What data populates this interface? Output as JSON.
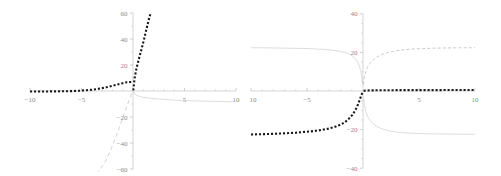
{
  "figure": {
    "title": "",
    "plot_count": 2,
    "background_color": "#ffffff"
  },
  "chart_data": [
    {
      "id": "left-plot",
      "type": "line",
      "title": "",
      "xlabel": "",
      "ylabel": "",
      "xlim": [
        -10,
        10
      ],
      "ylim": [
        -60,
        60
      ],
      "grid": false,
      "legend": null,
      "axis_style": "crossed-at-origin",
      "xticks": [
        -10,
        -5,
        5,
        10
      ],
      "xtick_labels": [
        "-10",
        "-5",
        "5",
        "10"
      ],
      "yticks": [
        -60,
        -40,
        -20,
        20,
        40,
        60
      ],
      "ytick_labels": [
        "-60",
        "-40",
        "-20",
        "20",
        "40",
        "60"
      ],
      "minor_tick_spacing_x": 1,
      "minor_tick_spacing_y": 10,
      "series": [
        {
          "name": "black-dotted-branch",
          "style": "dotted",
          "color": "#1a1a1a",
          "width": 2.1,
          "x": [
            -10,
            -9.5,
            -9,
            -8.5,
            -8,
            -7.5,
            -7,
            -6.5,
            -6,
            -5.5,
            -5,
            -4.5,
            -4,
            -3.5,
            -3,
            -2.5,
            -2,
            -1.5,
            -1,
            -0.75,
            -0.5,
            -0.25,
            -0.12,
            -0.05
          ],
          "y": [
            -0.4,
            -0.4,
            -0.4,
            -0.4,
            -0.3,
            -0.3,
            -0.2,
            -0.2,
            -0.1,
            0.1,
            0.3,
            0.6,
            1.0,
            1.5,
            2.2,
            3.0,
            4.0,
            5.0,
            6.0,
            6.5,
            6.8,
            6.9,
            6.9,
            6.8
          ]
        },
        {
          "name": "black-dotted-steep-branch",
          "style": "dotted",
          "color": "#1a1a1a",
          "width": 2.1,
          "x": [
            0.02,
            0.08,
            0.16,
            0.3,
            0.45,
            0.6,
            0.75,
            0.9,
            1.05,
            1.2,
            1.35,
            1.5,
            1.62,
            1.72
          ],
          "y": [
            0.5,
            4.0,
            10.0,
            16.0,
            21.0,
            25.5,
            30.0,
            34.5,
            39.0,
            44.0,
            49.0,
            54.0,
            57.5,
            59.8
          ]
        },
        {
          "name": "gray-solid-lower-branch",
          "style": "solid",
          "color": "#cfcfcf",
          "width": 0.7,
          "x": [
            0.05,
            0.3,
            0.8,
            1.5,
            2.5,
            4,
            6,
            8,
            10
          ],
          "y": [
            -1.0,
            -3.2,
            -4.6,
            -5.4,
            -6.2,
            -7.0,
            -7.6,
            -8.0,
            -8.3
          ]
        },
        {
          "name": "gray-dashed-steep-descending",
          "style": "dashed",
          "color": "#cccccc",
          "width": 0.9,
          "x": [
            -0.15,
            -0.6,
            -1.1,
            -1.6,
            -2.1,
            -2.6,
            -3.0,
            -3.4
          ],
          "y": [
            -2.0,
            -12.0,
            -23.0,
            -34.0,
            -44.0,
            -53.0,
            -58.0,
            -62.0
          ]
        }
      ]
    },
    {
      "id": "right-plot",
      "type": "line",
      "title": "",
      "xlabel": "",
      "ylabel": "",
      "xlim": [
        -10,
        10
      ],
      "ylim": [
        -40,
        40
      ],
      "grid": false,
      "legend": null,
      "axis_style": "crossed-at-origin",
      "xticks": [
        -10,
        -5,
        5,
        10
      ],
      "xtick_labels": [
        "-10",
        "-5",
        "5",
        "10"
      ],
      "yticks": [
        -40,
        -20,
        20,
        40
      ],
      "ytick_labels": [
        "-40",
        "-20",
        "20",
        "40"
      ],
      "minor_tick_spacing_x": 1,
      "minor_tick_spacing_y": 5,
      "series": [
        {
          "name": "black-dotted-sigmoid-left",
          "style": "dotted",
          "color": "#1a1a1a",
          "width": 2.1,
          "x": [
            -10,
            -9.3,
            -8.6,
            -8,
            -7.3,
            -6.6,
            -6,
            -5.4,
            -4.8,
            -4.2,
            -3.6,
            -3.1,
            -2.6,
            -2.2,
            -1.8,
            -1.5,
            -1.2,
            -0.95,
            -0.75,
            -0.55,
            -0.4,
            -0.28,
            -0.18,
            -0.1,
            -0.05
          ],
          "y": [
            -22.5,
            -22.4,
            -22.3,
            -22.2,
            -22.0,
            -21.8,
            -21.6,
            -21.3,
            -21.0,
            -20.6,
            -20.1,
            -19.5,
            -18.7,
            -17.9,
            -16.8,
            -15.6,
            -14.0,
            -12.4,
            -10.6,
            -8.4,
            -6.3,
            -4.4,
            -2.8,
            -1.5,
            -0.6
          ]
        },
        {
          "name": "black-dotted-flat-right",
          "style": "dotted",
          "color": "#1a1a1a",
          "width": 2.1,
          "x": [
            0.05,
            0.6,
            1.2,
            1.9,
            2.6,
            3.3,
            4.1,
            4.9,
            5.7,
            6.5,
            7.3,
            8.1,
            8.9,
            9.6,
            10
          ],
          "y": [
            0.15,
            0.3,
            0.35,
            0.4,
            0.42,
            0.44,
            0.45,
            0.46,
            0.47,
            0.47,
            0.48,
            0.48,
            0.48,
            0.49,
            0.49
          ]
        },
        {
          "name": "gray-solid-upper-left",
          "style": "solid",
          "color": "#cfcfcf",
          "width": 0.7,
          "x": [
            -10,
            -9,
            -8,
            -7,
            -6,
            -5,
            -4.2,
            -3.4,
            -2.7,
            -2.1,
            -1.6,
            -1.2,
            -0.9,
            -0.65,
            -0.45,
            -0.3,
            -0.18,
            -0.1,
            -0.04
          ],
          "y": [
            22.4,
            22.4,
            22.3,
            22.2,
            22.1,
            22.0,
            21.8,
            21.5,
            21.1,
            20.6,
            19.9,
            19.0,
            17.9,
            16.5,
            14.7,
            12.5,
            9.8,
            6.8,
            3.5
          ]
        },
        {
          "name": "gray-dashed-upper-right",
          "style": "dashed",
          "color": "#c4c4c4",
          "width": 0.9,
          "x": [
            0.04,
            0.12,
            0.25,
            0.4,
            0.6,
            0.85,
            1.15,
            1.5,
            1.9,
            2.4,
            3.0,
            3.7,
            4.5,
            5.4,
            6.4,
            7.5,
            8.6,
            9.6,
            10
          ],
          "y": [
            3.5,
            7.0,
            10.0,
            12.3,
            14.2,
            15.9,
            17.3,
            18.4,
            19.4,
            20.2,
            20.9,
            21.4,
            21.8,
            22.0,
            22.2,
            22.3,
            22.4,
            22.4,
            22.4
          ]
        },
        {
          "name": "gray-solid-lower-right",
          "style": "solid",
          "color": "#cfcfcf",
          "width": 0.7,
          "x": [
            0.04,
            0.12,
            0.25,
            0.42,
            0.65,
            0.95,
            1.3,
            1.75,
            2.3,
            3.0,
            3.8,
            4.8,
            6.0,
            7.4,
            8.8,
            10
          ],
          "y": [
            -3.0,
            -7.0,
            -10.5,
            -13.2,
            -15.4,
            -17.2,
            -18.6,
            -19.7,
            -20.6,
            -21.3,
            -21.7,
            -22.0,
            -22.2,
            -22.3,
            -22.4,
            -22.4
          ]
        }
      ]
    }
  ]
}
